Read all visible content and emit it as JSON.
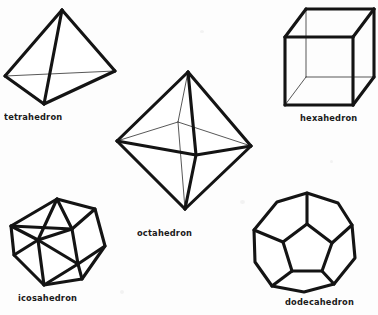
{
  "figure": {
    "background_color": "#fdfdfd",
    "ink_color": "#141414",
    "hidden_edge_color": "#3a3a3a",
    "width": 378,
    "height": 315
  },
  "solids": [
    {
      "id": "tetrahedron",
      "label": "tetrahedron",
      "faces": 4,
      "face_shape": "triangle",
      "label_position": {
        "x": 4,
        "y": 112
      },
      "vertices": {
        "apex": {
          "x": 62,
          "y": 10
        },
        "left": {
          "x": 5,
          "y": 76
        },
        "right": {
          "x": 115,
          "y": 71
        },
        "bottom": {
          "x": 44,
          "y": 104
        }
      },
      "front_edges": [
        [
          "apex",
          "left"
        ],
        [
          "apex",
          "right"
        ],
        [
          "apex",
          "bottom"
        ],
        [
          "left",
          "bottom"
        ],
        [
          "right",
          "bottom"
        ]
      ],
      "hidden_edges": [
        [
          "left",
          "right"
        ]
      ]
    },
    {
      "id": "hexahedron",
      "label": "hexahedron",
      "faces": 6,
      "face_shape": "square",
      "label_position": {
        "x": 300,
        "y": 113
      },
      "vertices": {
        "front_tl": {
          "x": 285,
          "y": 37
        },
        "front_tr": {
          "x": 353,
          "y": 37
        },
        "front_br": {
          "x": 353,
          "y": 105
        },
        "front_bl": {
          "x": 285,
          "y": 105
        },
        "back_tl": {
          "x": 306,
          "y": 9
        },
        "back_tr": {
          "x": 374,
          "y": 9
        },
        "back_br": {
          "x": 374,
          "y": 77
        },
        "back_bl": {
          "x": 306,
          "y": 77
        }
      },
      "front_edges": [
        [
          "front_tl",
          "front_tr"
        ],
        [
          "front_tr",
          "front_br"
        ],
        [
          "front_br",
          "front_bl"
        ],
        [
          "front_bl",
          "front_tl"
        ],
        [
          "back_tl",
          "back_tr"
        ],
        [
          "back_tr",
          "back_br"
        ],
        [
          "front_tl",
          "back_tl"
        ],
        [
          "front_tr",
          "back_tr"
        ],
        [
          "front_br",
          "back_br"
        ]
      ],
      "hidden_edges": [
        [
          "back_bl",
          "back_tl"
        ],
        [
          "back_bl",
          "back_br"
        ],
        [
          "front_bl",
          "back_bl"
        ]
      ]
    },
    {
      "id": "octahedron",
      "label": "octahedron",
      "faces": 8,
      "face_shape": "triangle",
      "label_position": {
        "x": 137,
        "y": 228
      },
      "vertices": {
        "top": {
          "x": 188,
          "y": 72
        },
        "bottom": {
          "x": 185,
          "y": 209
        },
        "left": {
          "x": 117,
          "y": 141
        },
        "right": {
          "x": 251,
          "y": 146
        },
        "front": {
          "x": 196,
          "y": 155
        },
        "back": {
          "x": 178,
          "y": 122
        }
      },
      "front_edges": [
        [
          "top",
          "left"
        ],
        [
          "top",
          "right"
        ],
        [
          "bottom",
          "left"
        ],
        [
          "bottom",
          "right"
        ],
        [
          "top",
          "front"
        ],
        [
          "bottom",
          "front"
        ],
        [
          "left",
          "front"
        ],
        [
          "right",
          "front"
        ]
      ],
      "hidden_edges": [
        [
          "top",
          "back"
        ],
        [
          "bottom",
          "back"
        ],
        [
          "left",
          "back"
        ],
        [
          "right",
          "back"
        ]
      ]
    },
    {
      "id": "icosahedron",
      "label": "icosahedron",
      "faces": 20,
      "face_shape": "triangle",
      "label_position": {
        "x": 18,
        "y": 293
      },
      "outline": [
        {
          "x": 57,
          "y": 199
        },
        {
          "x": 95,
          "y": 209
        },
        {
          "x": 105,
          "y": 246
        },
        {
          "x": 82,
          "y": 279
        },
        {
          "x": 44,
          "y": 285
        },
        {
          "x": 14,
          "y": 255
        },
        {
          "x": 11,
          "y": 226
        }
      ],
      "inner_vertices": [
        {
          "x": 72,
          "y": 229
        },
        {
          "x": 38,
          "y": 240
        },
        {
          "x": 78,
          "y": 264
        }
      ]
    },
    {
      "id": "dodecahedron",
      "label": "dodecahedron",
      "faces": 12,
      "face_shape": "pentagon",
      "label_position": {
        "x": 285,
        "y": 297
      },
      "outline": [
        {
          "x": 307,
          "y": 193
        },
        {
          "x": 338,
          "y": 203
        },
        {
          "x": 352,
          "y": 225
        },
        {
          "x": 355,
          "y": 258
        },
        {
          "x": 334,
          "y": 284
        },
        {
          "x": 304,
          "y": 292
        },
        {
          "x": 272,
          "y": 286
        },
        {
          "x": 255,
          "y": 262
        },
        {
          "x": 254,
          "y": 230
        },
        {
          "x": 277,
          "y": 202
        }
      ],
      "inner_pentagon": [
        {
          "x": 307,
          "y": 224
        },
        {
          "x": 332,
          "y": 243
        },
        {
          "x": 322,
          "y": 271
        },
        {
          "x": 292,
          "y": 271
        },
        {
          "x": 283,
          "y": 242
        }
      ]
    }
  ]
}
